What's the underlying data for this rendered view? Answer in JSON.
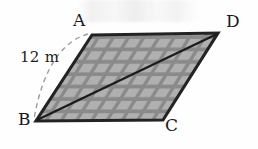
{
  "figure": {
    "type": "geometry-diagram",
    "shape": "parallelogram",
    "background_color": "#fefefe",
    "fill_color": "#8d8d8d",
    "tile_color": "#adadad",
    "outline_color": "#1f1f1f",
    "dashed_color": "#9a9a9a",
    "vertices": [
      {
        "name": "A",
        "label": "A",
        "x": 92,
        "y": 35
      },
      {
        "name": "D",
        "label": "D",
        "x": 218,
        "y": 33
      },
      {
        "name": "C",
        "label": "C",
        "x": 163,
        "y": 120
      },
      {
        "name": "B",
        "label": "B",
        "x": 36,
        "y": 121
      }
    ],
    "diagonal": {
      "from": "B",
      "to": "D"
    },
    "measurement": {
      "label": "12 m",
      "value": 12,
      "unit": "m",
      "measures_side": "AB",
      "style": "dashed-arc"
    }
  },
  "labels": {
    "a": "A",
    "b": "B",
    "c": "C",
    "d": "D",
    "side_length": "12 m"
  }
}
